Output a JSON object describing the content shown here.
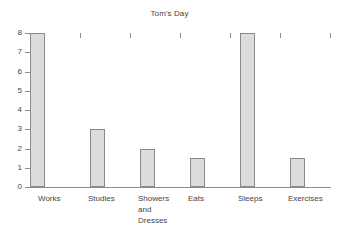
{
  "chart_data": {
    "type": "bar",
    "title": "Tom's Day",
    "xlabel": "",
    "ylabel": "",
    "categories": [
      "Works",
      "Studies",
      "Showers\nand\nDresses",
      "Eats",
      "Sleeps",
      "Exercises"
    ],
    "values": [
      8,
      3,
      2,
      1.5,
      8,
      1.5
    ],
    "ylim": [
      0,
      8
    ],
    "yticks": [
      0,
      1,
      2,
      3,
      4,
      5,
      6,
      7,
      8
    ],
    "ytick_labels": [
      "0",
      "1",
      "2",
      "3",
      "4",
      "5",
      "6",
      "7",
      "8"
    ],
    "grid": false,
    "legend": false,
    "bar_fill_color": "#dcdcdc",
    "bar_edge_color": "#8a8a8a",
    "axis_color": "#8c8c8c",
    "text_color": "#454545",
    "background_color": "#ffffff"
  }
}
